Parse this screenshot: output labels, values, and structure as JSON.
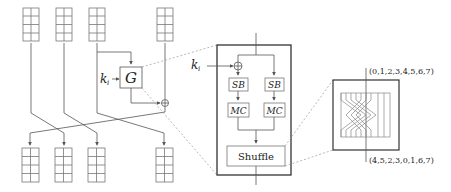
{
  "diagram": {
    "left_structure": {
      "key_label": "k",
      "key_subscript": "i",
      "function_label": "G",
      "state_columns": 4,
      "cells_per_column": 4
    },
    "g_function": {
      "key_label": "k",
      "key_subscript": "i",
      "blocks": {
        "sb_left": "SB",
        "sb_right": "SB",
        "mc_left": "MC",
        "mc_right": "MC",
        "shuffle": "Shuffle"
      }
    },
    "shuffle_detail": {
      "input_order": "(0,1,2,3,4,5,6,7)",
      "output_order": "(4,5,2,3,0,1,6,7)"
    },
    "colors": {
      "line": "#555555",
      "box_border": "#777777",
      "thick_border": "#333333",
      "dashed": "#999999",
      "text": "#222222"
    }
  }
}
